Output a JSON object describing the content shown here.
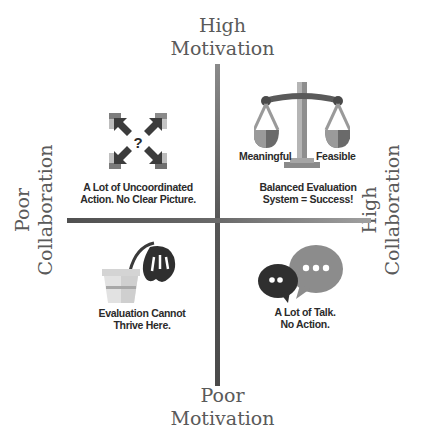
{
  "axes": {
    "top": {
      "line1": "High",
      "line2": "Motivation"
    },
    "bottom": {
      "line1": "Poor",
      "line2": "Motivation"
    },
    "left": {
      "line1": "Poor",
      "line2": "Collaboration"
    },
    "right": {
      "line1": "High",
      "line2": "Collaboration"
    }
  },
  "quadrants": {
    "top_left": {
      "icon": "scattered-arrows-question-icon",
      "line1": "A Lot of Uncoordinated",
      "line2": "Action. No Clear Picture."
    },
    "top_right": {
      "icon": "balance-scale-icon",
      "scale_left_label": "Meaningful",
      "scale_right_label": "Feasible",
      "line1": "Balanced Evaluation",
      "line2": "System = Success!"
    },
    "bottom_left": {
      "icon": "wilted-flower-pot-icon",
      "line1": "Evaluation Cannot",
      "line2": "Thrive Here."
    },
    "bottom_right": {
      "icon": "speech-bubbles-icon",
      "line1": "A Lot of Talk.",
      "line2": "No Action."
    }
  },
  "colors": {
    "axis_text": "#5a5a5a",
    "caption_text": "#2b2b2b",
    "dark_gray": "#3a3a3a",
    "mid_gray": "#8c8c8c",
    "light_gray": "#c8c8c8"
  }
}
